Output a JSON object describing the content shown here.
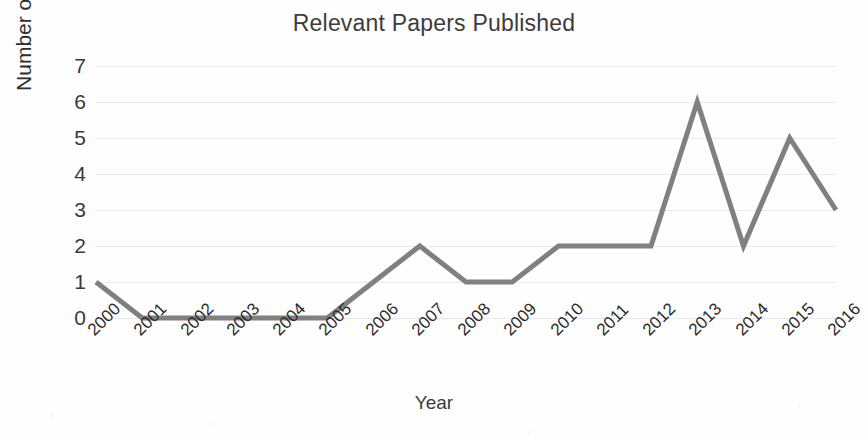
{
  "chart_data": {
    "type": "line",
    "title": "Relevant Papers Published",
    "xlabel": "Year",
    "ylabel": "Number of papers published",
    "categories": [
      "2000",
      "2001",
      "2002",
      "2003",
      "2004",
      "2005",
      "2006",
      "2007",
      "2008",
      "2009",
      "2010",
      "2011",
      "2012",
      "2013",
      "2014",
      "2015",
      "2016"
    ],
    "values": [
      1,
      0,
      0,
      0,
      0,
      0,
      1,
      2,
      1,
      1,
      2,
      2,
      2,
      6,
      2,
      5,
      3
    ],
    "series": [
      {
        "name": "Number of papers published",
        "values": [
          1,
          0,
          0,
          0,
          0,
          0,
          1,
          2,
          1,
          1,
          2,
          2,
          2,
          6,
          2,
          5,
          3
        ]
      }
    ],
    "ylim": [
      0,
      7
    ],
    "y_ticks": [
      0,
      1,
      2,
      3,
      4,
      5,
      6,
      7
    ],
    "grid": true,
    "legend": false,
    "legend_position": "none",
    "line_color": "#808080",
    "grid_color": "#e9e9ee",
    "text_color": "#3a3a3a",
    "background_color": "#ffffff",
    "x_tick_rotation": -45,
    "markers": false,
    "line_width": 5
  }
}
